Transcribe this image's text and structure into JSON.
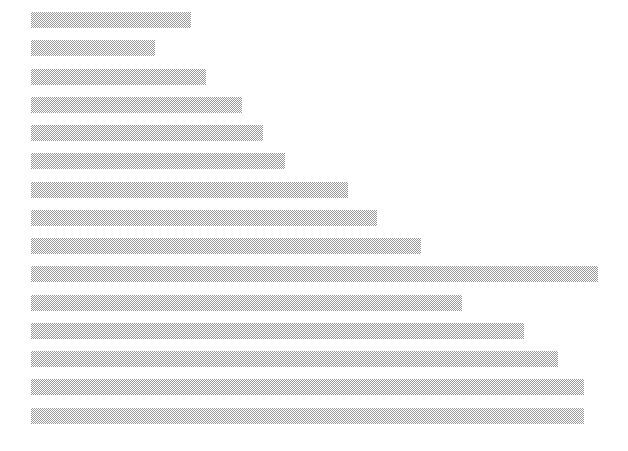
{
  "chart": {
    "type": "bar",
    "orientation": "horizontal",
    "title": "",
    "subtitle": "",
    "xlabel": "",
    "ylabel": "",
    "background_color": "#ffffff",
    "bar_color": "#c8c8c8",
    "bar_pattern": "checkerboard-dither",
    "grid": false,
    "legend": false,
    "axes_visible": false,
    "tick_labels_visible": false
  },
  "chart_data": {
    "type": "bar",
    "orientation": "horizontal",
    "title": "",
    "xlabel": "",
    "ylabel": "",
    "grid": false,
    "legend_position": "none",
    "categories": [
      "1",
      "2",
      "3",
      "4",
      "5",
      "6",
      "7",
      "8",
      "9",
      "10",
      "11",
      "12",
      "13",
      "14",
      "15"
    ],
    "values": [
      160,
      124,
      175,
      211,
      232,
      254,
      317,
      346,
      390,
      567,
      431,
      493,
      527,
      553,
      553
    ],
    "xlim": [
      0,
      597
    ],
    "bar_count": 15,
    "bar_color": "#c8c8c8"
  },
  "geometry": {
    "plot_left": 31,
    "bar_height": 16,
    "bar_pitch": 28.3,
    "first_bar_top": 12,
    "bars": [
      {
        "name": "bar-1",
        "top": 12,
        "width": 160
      },
      {
        "name": "bar-2",
        "top": 40,
        "width": 124
      },
      {
        "name": "bar-3",
        "top": 69,
        "width": 175
      },
      {
        "name": "bar-4",
        "top": 97,
        "width": 211
      },
      {
        "name": "bar-5",
        "top": 125,
        "width": 232
      },
      {
        "name": "bar-6",
        "top": 153,
        "width": 254
      },
      {
        "name": "bar-7",
        "top": 182,
        "width": 317
      },
      {
        "name": "bar-8",
        "top": 210,
        "width": 346
      },
      {
        "name": "bar-9",
        "top": 238,
        "width": 390
      },
      {
        "name": "bar-10",
        "top": 266,
        "width": 567
      },
      {
        "name": "bar-11",
        "top": 295,
        "width": 431
      },
      {
        "name": "bar-12",
        "top": 323,
        "width": 493
      },
      {
        "name": "bar-13",
        "top": 351,
        "width": 527
      },
      {
        "name": "bar-14",
        "top": 379,
        "width": 553
      },
      {
        "name": "bar-15",
        "top": 408,
        "width": 553
      }
    ]
  }
}
